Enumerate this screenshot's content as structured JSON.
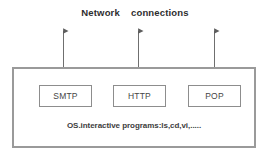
{
  "diagram": {
    "title": "Network    connections",
    "caption": "OS.interactive programs:ls,cd,vi,.....",
    "colors": {
      "background": "#ffffff",
      "outer_border": "#9a9a9a",
      "box_border": "#8d8d8d",
      "text": "#3a3a3a",
      "arrow": "#6f6f6f"
    },
    "boxes": [
      {
        "label": "SMTP"
      },
      {
        "label": "HTTP"
      },
      {
        "label": "POP"
      }
    ],
    "arrows": [
      {
        "name": "arrow-smtp",
        "direction": "double-vertical"
      },
      {
        "name": "arrow-http",
        "direction": "double-vertical"
      },
      {
        "name": "arrow-pop",
        "direction": "double-vertical"
      }
    ]
  }
}
